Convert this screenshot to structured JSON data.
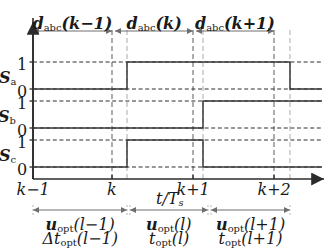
{
  "figure": {
    "type": "timing-diagram",
    "colors": {
      "trace": "#3a3a3a",
      "axis": "#2b2b2b",
      "grid_dark": "#8a8a8a",
      "grid_light": "#b9b9b9",
      "arrow": "#6e6e6e",
      "text": "#1a1a1a"
    }
  },
  "top_intervals": [
    {
      "label": "d",
      "sub": "abc",
      "arg": "(k−1)",
      "x0": 33,
      "x1": 112
    },
    {
      "label": "d",
      "sub": "abc",
      "arg": "(k)",
      "x0": 115,
      "x1": 193
    },
    {
      "label": "d",
      "sub": "abc",
      "arg": "(k+1)",
      "x0": 196,
      "x1": 274
    }
  ],
  "signals": [
    {
      "name": "S",
      "sub": "a",
      "levels": [
        "1",
        "0"
      ],
      "baseline_y": 89,
      "high_y": 62,
      "segments": [
        {
          "from": 33,
          "to": 127,
          "level": 0
        },
        {
          "from": 127,
          "to": 290,
          "level": 1
        },
        {
          "from": 290,
          "to": 322,
          "level": 0
        }
      ]
    },
    {
      "name": "S",
      "sub": "b",
      "levels": [
        "1",
        "0"
      ],
      "baseline_y": 128,
      "high_y": 101,
      "segments": [
        {
          "from": 33,
          "to": 203,
          "level": 0
        },
        {
          "from": 203,
          "to": 322,
          "level": 1
        }
      ]
    },
    {
      "name": "S",
      "sub": "c",
      "levels": [
        "1",
        "0"
      ],
      "baseline_y": 167,
      "high_y": 140,
      "segments": [
        {
          "from": 33,
          "to": 127,
          "level": 0
        },
        {
          "from": 127,
          "to": 203,
          "level": 1
        },
        {
          "from": 203,
          "to": 322,
          "level": 0
        }
      ]
    }
  ],
  "x_axis": {
    "label": "t/T",
    "label_sub": "s",
    "y": 179,
    "ticks": [
      {
        "text": "k−1",
        "x": 33
      },
      {
        "text": "k",
        "x": 112
      },
      {
        "text": "k+1",
        "x": 193
      },
      {
        "text": "k+2",
        "x": 274
      }
    ],
    "gridlines_dark": [
      33,
      112,
      193,
      274
    ],
    "gridlines_light": [
      127,
      203,
      290
    ]
  },
  "bottom_intervals": [
    {
      "u": "u",
      "u_sub": "opt",
      "u_arg": "(l−1)",
      "t": "Δt",
      "t_sub": "opt",
      "t_arg": "(l−1)",
      "x0": 33,
      "x1": 127
    },
    {
      "u": "u",
      "u_sub": "opt",
      "u_arg": "(l)",
      "t": "t",
      "t_sub": "opt",
      "t_arg": "(l)",
      "x0": 130,
      "x1": 208
    },
    {
      "u": "u",
      "u_sub": "opt",
      "u_arg": "(l+1)",
      "t": "t",
      "t_sub": "opt",
      "t_arg": "(l+1)",
      "x0": 211,
      "x1": 290
    }
  ]
}
